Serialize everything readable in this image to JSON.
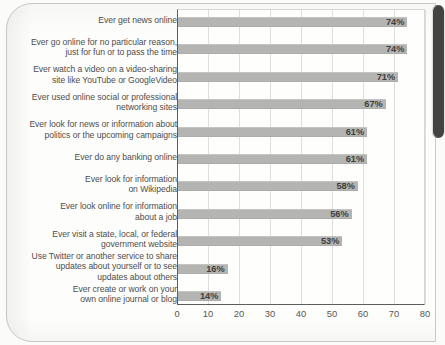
{
  "chart_data": {
    "type": "bar",
    "orientation": "horizontal",
    "title": "",
    "subtitle": "",
    "xlabel": "",
    "ylabel": "",
    "xlim": [
      0,
      80
    ],
    "xticks": [
      0,
      10,
      20,
      30,
      40,
      50,
      60,
      70,
      80
    ],
    "xtick_labels": [
      "0",
      "10",
      "20",
      "30",
      "40",
      "50",
      "60",
      "70",
      "80"
    ],
    "grid": "vertical",
    "legend": "none",
    "value_suffix": "%",
    "bar_color": "#b4b4b2",
    "categories": [
      "Ever get news online",
      "Ever go online for no particular reason,\njust for fun or to pass the time",
      "Ever watch a video on a video-sharing\nsite like YouTube or GoogleVideo",
      "Ever used online social or professional\nnetworking sites",
      "Ever look for news or information about\npolitics or the upcoming campaigns",
      "Ever do any banking online",
      "Ever look for information\non Wikipedia",
      "Ever look online for information\nabout a job",
      "Ever visit a state, local, or federal\ngovernment website",
      "Use Twitter or another service to share\nupdates about yourself or to see\nupdates about others",
      "Ever create or work on your\nown online journal or blog"
    ],
    "values": [
      74,
      74,
      71,
      67,
      61,
      61,
      58,
      56,
      53,
      16,
      14
    ],
    "value_labels": [
      "74%",
      "74%",
      "71%",
      "67%",
      "61%",
      "61%",
      "58%",
      "56%",
      "53%",
      "16%",
      "14%"
    ]
  }
}
